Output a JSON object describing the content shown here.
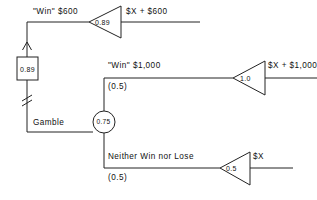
{
  "diagram": {
    "stroke_color": "#222222",
    "background": "#ffffff",
    "branches": {
      "top": {
        "label": "\"Win\"  $600",
        "gain_triangle_value": "0.89",
        "output_label": "$X + $600"
      },
      "middle": {
        "label": "\"Win\"  $1,000",
        "probability": "(0.5)",
        "gain_triangle_value": "1.0",
        "output_label": "$X + $1,000"
      },
      "bottom": {
        "label": "Neither  Win nor Lose",
        "probability": "(0.5)",
        "gain_triangle_value": "0.5",
        "output_label": "$X"
      }
    },
    "feedback": {
      "box_value": "0.89",
      "input_label": "Gamble",
      "break_symbol": "double-slash-break"
    },
    "junction": {
      "circle_value": "0.75"
    }
  }
}
